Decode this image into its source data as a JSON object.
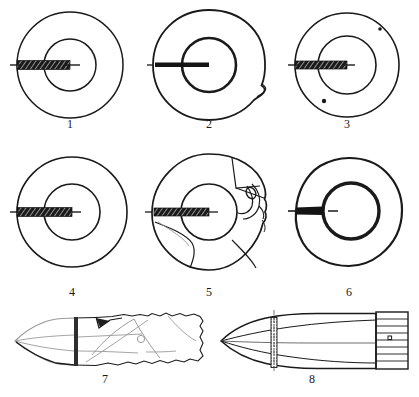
{
  "plate": {
    "title": "Plate of ring-shaped artefacts and projectile profiles",
    "width": 419,
    "height": 397,
    "background_color": "#ffffff",
    "ink_color": "#1a1a1a",
    "faint_ink_color": "#9a9a9a",
    "rows": 3
  },
  "figures": [
    {
      "id": 1,
      "label": "1",
      "type": "ring-plan",
      "description": "Plain annular ring, smooth circular outer and inner edges, with hatched radial section bar at the left (9 o'clock)",
      "center": {
        "x": 70,
        "y": 65
      },
      "outer_radius": 53,
      "inner_radius": 26,
      "section_bar": {
        "side": "left",
        "fill": "hatched-dark",
        "thickness": 9
      },
      "label_pos": {
        "x": 70,
        "y": 124
      }
    },
    {
      "id": 2,
      "label": "2",
      "type": "ring-plan",
      "description": "Annular ring with irregular outer edge and a pointed spur protrusion on the right side; thickened inner circle; thin dark section bar at left",
      "center": {
        "x": 209,
        "y": 65
      },
      "outer_radius": 55,
      "inner_radius": 27,
      "section_bar": {
        "side": "left",
        "fill": "solid-dark",
        "thickness": 5
      },
      "feature": "right-side spur / notch",
      "label_pos": {
        "x": 209,
        "y": 124
      }
    },
    {
      "id": 3,
      "label": "3",
      "type": "ring-plan",
      "description": "Annular ring with two small perforations (dots), one upper-right and one lower-left in the ring band; hatched section bar at left",
      "center": {
        "x": 347,
        "y": 65
      },
      "outer_radius": 52,
      "inner_radius": 29,
      "section_bar": {
        "side": "left",
        "fill": "hatched-dark",
        "thickness": 8
      },
      "perforations": [
        {
          "x": 380,
          "y": 29,
          "r": 1.8
        },
        {
          "x": 324,
          "y": 101,
          "r": 2.2
        }
      ],
      "label_pos": {
        "x": 347,
        "y": 124
      }
    },
    {
      "id": 4,
      "label": "4",
      "type": "ring-plan",
      "description": "Plain annular ring, slightly wider band; hatched radial section bar at the left",
      "center": {
        "x": 72,
        "y": 212
      },
      "outer_radius": 55,
      "inner_radius": 28,
      "section_bar": {
        "side": "left",
        "fill": "hatched-dark",
        "thickness": 9
      },
      "label_pos": {
        "x": 72,
        "y": 292
      }
    },
    {
      "id": 5,
      "label": "5",
      "type": "ring-plan-fragmented",
      "description": "Annular ring broken into several joined fragments; crack lines radiate across the band, with a complex damaged zone in the upper right; hatched section bar at left",
      "center": {
        "x": 209,
        "y": 212
      },
      "outer_radius": 58,
      "inner_radius": 28,
      "section_bar": {
        "side": "left",
        "fill": "hatched-dark",
        "thickness": 8
      },
      "fracture_lines": 6,
      "label_pos": {
        "x": 209,
        "y": 292
      }
    },
    {
      "id": 6,
      "label": "6",
      "type": "ring-plan",
      "description": "Annular ring with heavy bold inner circle and irregular outer contour; wedge-shaped dark section bar at left",
      "center": {
        "x": 349,
        "y": 212
      },
      "outer_radius": 54,
      "inner_radius": 28,
      "section_bar": {
        "side": "left",
        "fill": "solid-dark-wedge",
        "thickness": 7
      },
      "label_pos": {
        "x": 349,
        "y": 292
      }
    },
    {
      "id": 7,
      "label": "7",
      "type": "projectile-profile-fragment",
      "description": "Side profile of an elongated pointed projectile preserved as a fragment; faint grey tip at left, a dark vertical cannelure band, internal fracture lines, a small circular perforation, and a ragged broken right margin",
      "bbox": {
        "x": 14,
        "y": 313,
        "width": 190,
        "height": 56
      },
      "features": [
        "grey ogival tip",
        "vertical band line",
        "small circular hole",
        "jagged broken right edge"
      ],
      "label_pos": {
        "x": 105,
        "y": 376
      }
    },
    {
      "id": 8,
      "label": "8",
      "type": "projectile-profile-reconstruction",
      "description": "Reconstructed complete projectile in side profile: sharp ogival point at left, a stippled vertical band near the front, a long tapering body, and a ribbed/striated cylindrical base block at the right containing a small circular mark",
      "bbox": {
        "x": 220,
        "y": 313,
        "width": 190,
        "height": 56
      },
      "features": [
        "ogival point",
        "stippled vertical band",
        "centreline axis",
        "striated rear block",
        "small circular mark"
      ],
      "label_pos": {
        "x": 312,
        "y": 376
      }
    }
  ],
  "labels": {
    "fig1": "1",
    "fig2": "2",
    "fig3": "3",
    "fig4": "4",
    "fig5": "5",
    "fig6": "6",
    "fig7": "7",
    "fig8": "8"
  }
}
